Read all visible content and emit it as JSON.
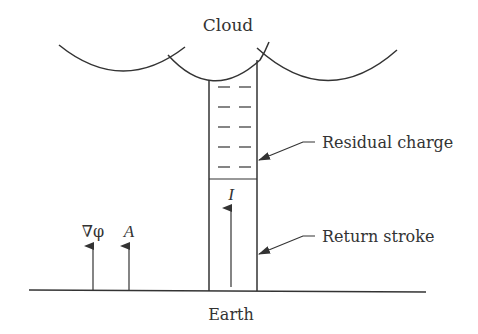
{
  "diagram": {
    "type": "lightning-channel-schematic",
    "labels": {
      "cloud": "Cloud",
      "earth": "Earth",
      "residual_charge": "Residual charge",
      "return_stroke": "Return stroke",
      "current": "I",
      "grad_phi": "∇φ",
      "vector_potential": "A"
    },
    "charge_symbol": "−",
    "charge_rows": 5,
    "charge_columns": 2,
    "colors": {
      "ink": "#333333",
      "background": "#ffffff"
    }
  }
}
